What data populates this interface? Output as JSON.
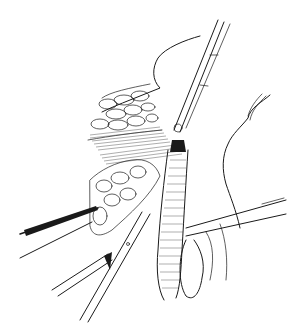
{
  "image": {
    "description": "Pen-and-ink surgical illustration showing an open operative field with retracted tissue, forceps, clamps and scissors dissecting along a vessel bundle",
    "colors": {
      "background": "#ffffff",
      "ink": "#1a1a1a"
    }
  }
}
